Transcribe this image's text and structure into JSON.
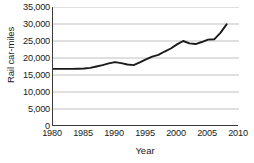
{
  "chart_data": {
    "type": "line",
    "title": "",
    "xlabel": "Year",
    "ylabel": "Rail car-miles",
    "xlim": [
      1980,
      2010
    ],
    "ylim": [
      0,
      35000
    ],
    "grid": true,
    "legend": false,
    "xticks": [
      1980,
      1985,
      1990,
      1995,
      2000,
      2005,
      2010
    ],
    "xtick_labels": [
      "1980",
      "1985",
      "1990",
      "1995",
      "2000",
      "2005",
      "2010"
    ],
    "yticks": [
      0,
      5000,
      10000,
      15000,
      20000,
      25000,
      30000,
      35000
    ],
    "ytick_labels": [
      "0",
      "5,000",
      "10,000",
      "15,000",
      "20,000",
      "25,000",
      "30,000",
      "35,000"
    ],
    "series": [
      {
        "name": "Rail car-miles",
        "color": "#1a1a1a",
        "x": [
          1980,
          1981,
          1982,
          1983,
          1984,
          1985,
          1986,
          1987,
          1988,
          1989,
          1990,
          1991,
          1992,
          1993,
          1994,
          1995,
          1996,
          1997,
          1998,
          1999,
          2000,
          2001,
          2002,
          2003,
          2004,
          2005,
          2006,
          2007,
          2008
        ],
        "values": [
          16800,
          16800,
          16800,
          16800,
          16850,
          16900,
          17100,
          17500,
          17900,
          18400,
          18800,
          18500,
          18100,
          17900,
          18700,
          19600,
          20400,
          20900,
          21900,
          22800,
          24000,
          25000,
          24300,
          24100,
          24700,
          25400,
          25500,
          27400,
          29900
        ]
      }
    ]
  }
}
